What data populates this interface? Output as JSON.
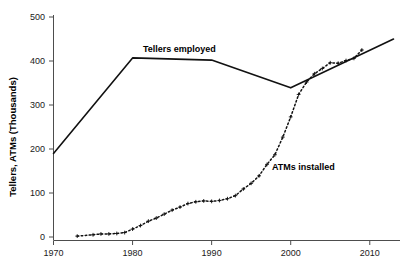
{
  "chart_data": {
    "type": "line",
    "title": "",
    "subtitle": "",
    "xlabel": "",
    "ylabel": "Tellers, ATMs (Thousands)",
    "xlim": [
      1970,
      2013
    ],
    "ylim": [
      0,
      500
    ],
    "xticks": [
      1970,
      1980,
      1990,
      2000,
      2010
    ],
    "xtick_labels": [
      "1970",
      "1980",
      "1990",
      "2000",
      "2010"
    ],
    "yticks": [
      0,
      100,
      200,
      300,
      400,
      500
    ],
    "ytick_labels": [
      "0",
      "100",
      "200",
      "300",
      "400",
      "500"
    ],
    "grid": false,
    "legend_position": "inline-annotation",
    "series": [
      {
        "name": "Tellers employed",
        "style": "solid-line",
        "marker": "none",
        "color": "#111111",
        "annotation": "Tellers employed",
        "x": [
          1970,
          1980,
          1990,
          2000,
          2013
        ],
        "values": [
          190,
          407,
          402,
          339,
          450
        ]
      },
      {
        "name": "ATMs installed",
        "style": "dotted-line",
        "marker": "plus",
        "color": "#111111",
        "annotation": "ATMs installed",
        "x": [
          1973,
          1975,
          1976,
          1977,
          1978,
          1979,
          1980,
          1981,
          1982,
          1983,
          1984,
          1985,
          1986,
          1987,
          1988,
          1989,
          1990,
          1991,
          1992,
          1993,
          1994,
          1995,
          1996,
          1997,
          1998,
          1999,
          2000,
          2001,
          2002,
          2003,
          2004,
          2005,
          2006,
          2007,
          2008,
          2009
        ],
        "values": [
          2,
          5,
          7,
          7,
          8,
          10,
          18,
          26,
          36,
          43,
          52,
          61,
          68,
          76,
          80,
          82,
          81,
          83,
          87,
          94,
          109,
          122,
          139,
          165,
          187,
          227,
          273,
          324,
          352,
          371,
          383,
          396,
          395,
          401,
          406,
          425
        ]
      }
    ],
    "annotations": [
      {
        "text": "Tellers employed",
        "x": 1980.5,
        "y": 425
      },
      {
        "text": "ATMs installed",
        "x": 2000.0,
        "y": 185
      }
    ]
  }
}
